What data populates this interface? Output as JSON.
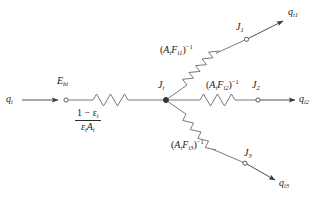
{
  "figure": {
    "stroke_color": "#555555",
    "text_color": "#1a1a1a",
    "node_fill": "#ffffff",
    "junction_fill": "#333333"
  },
  "labels": {
    "q_in": "q",
    "q_in_sub": "i",
    "eb": "E",
    "eb_sub": "bi",
    "junction": "J",
    "junction_sub": "i",
    "node_j1": "J",
    "node_j1_sub": "1",
    "node_j2": "J",
    "node_j2_sub": "2",
    "node_j3": "J",
    "node_j3_sub": "3",
    "q_i1": "q",
    "q_i1_sub": "i1",
    "q_i2": "q",
    "q_i2_sub": "i2",
    "q_i3": "q",
    "q_i3_sub": "i3"
  },
  "surface_resistance": {
    "numerator_lead": "1 − ε",
    "numerator_sub": "i",
    "denominator_first": "ε",
    "denominator_first_sub": "i",
    "denominator_second": "A",
    "denominator_second_sub": "i"
  },
  "space_resistances": [
    {
      "name": "branch-1",
      "open": "(",
      "a": "A",
      "a_sub": "i",
      "f": "F",
      "f_sub": "i1",
      "close": ")",
      "exp": "−1"
    },
    {
      "name": "branch-2",
      "open": "(",
      "a": "A",
      "a_sub": "i",
      "f": "F",
      "f_sub": "i2",
      "close": ")",
      "exp": "−1"
    },
    {
      "name": "branch-3",
      "open": "(",
      "a": "A",
      "a_sub": "i",
      "f": "F",
      "f_sub": "i3",
      "close": ")",
      "exp": "−1"
    }
  ]
}
